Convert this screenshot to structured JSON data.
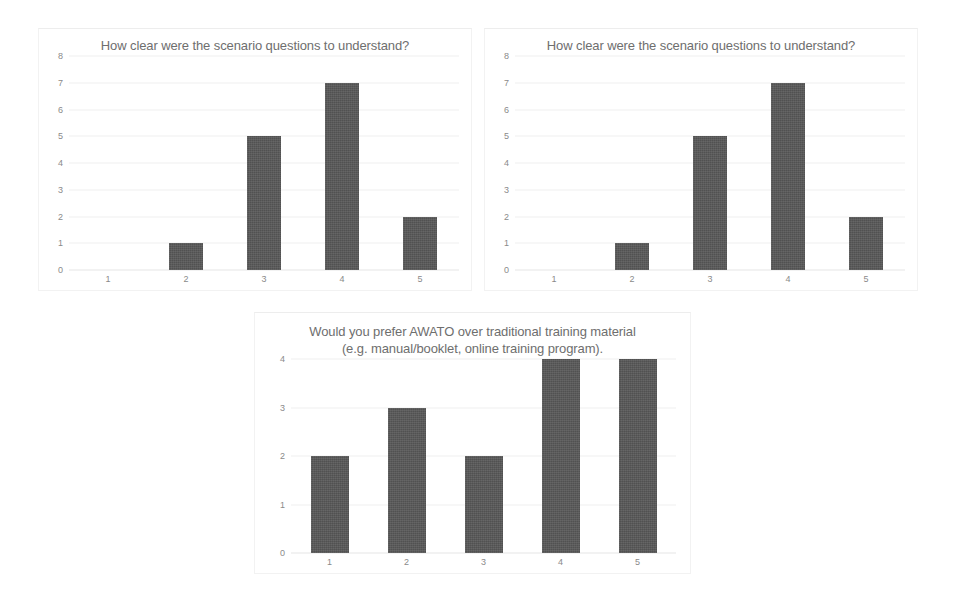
{
  "page": {
    "background_color": "#ffffff",
    "bar_color": "#575757",
    "title_color": "#6e6e6e",
    "tick_color": "#8a8a8a",
    "gridline_color": "#f0f0f0"
  },
  "charts": [
    {
      "id": "chart-clarity-left",
      "title": "How clear were the scenario questions to understand?",
      "categories": [
        "1",
        "2",
        "3",
        "4",
        "5"
      ],
      "values": [
        0,
        1,
        5,
        7,
        2
      ],
      "yticks": [
        "8",
        "7",
        "6",
        "5",
        "4",
        "3",
        "2",
        "1",
        "0"
      ]
    },
    {
      "id": "chart-clarity-right",
      "title": "How clear were the scenario questions to understand?",
      "categories": [
        "1",
        "2",
        "3",
        "4",
        "5"
      ],
      "values": [
        0,
        1,
        5,
        7,
        2
      ],
      "yticks": [
        "8",
        "7",
        "6",
        "5",
        "4",
        "3",
        "2",
        "1",
        "0"
      ]
    },
    {
      "id": "chart-awato-preference",
      "title": "Would you prefer AWATO over traditional training material (e.g. manual/booklet, online training program).",
      "categories": [
        "1",
        "2",
        "3",
        "4",
        "5"
      ],
      "values": [
        2,
        3,
        2,
        4,
        4
      ],
      "yticks": [
        "4",
        "3",
        "2",
        "1",
        "0"
      ]
    }
  ],
  "chart_data": [
    {
      "type": "bar",
      "title": "How clear were the scenario questions to understand?",
      "categories": [
        "1",
        "2",
        "3",
        "4",
        "5"
      ],
      "values": [
        0,
        1,
        5,
        7,
        2
      ],
      "xlabel": "",
      "ylabel": "",
      "ylim": [
        0,
        8
      ],
      "ytick_values": [
        0,
        1,
        2,
        3,
        4,
        5,
        6,
        7,
        8
      ],
      "grid": true,
      "legend": false
    },
    {
      "type": "bar",
      "title": "How clear were the scenario questions to understand?",
      "categories": [
        "1",
        "2",
        "3",
        "4",
        "5"
      ],
      "values": [
        0,
        1,
        5,
        7,
        2
      ],
      "xlabel": "",
      "ylabel": "",
      "ylim": [
        0,
        8
      ],
      "ytick_values": [
        0,
        1,
        2,
        3,
        4,
        5,
        6,
        7,
        8
      ],
      "grid": true,
      "legend": false
    },
    {
      "type": "bar",
      "title": "Would you prefer AWATO over traditional training material (e.g. manual/booklet, online training program).",
      "categories": [
        "1",
        "2",
        "3",
        "4",
        "5"
      ],
      "values": [
        2,
        3,
        2,
        4,
        4
      ],
      "xlabel": "",
      "ylabel": "",
      "ylim": [
        0,
        4
      ],
      "ytick_values": [
        0,
        1,
        2,
        3,
        4
      ],
      "grid": true,
      "legend": false
    }
  ]
}
